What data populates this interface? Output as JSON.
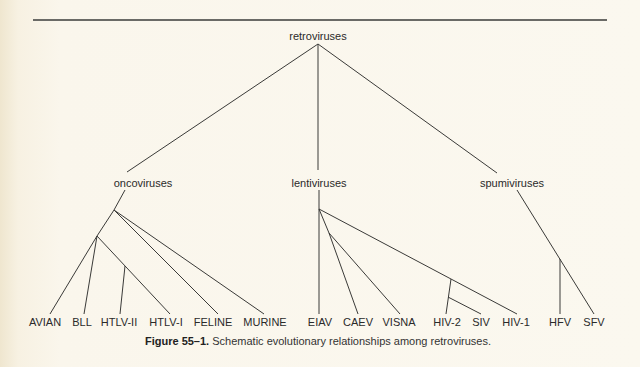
{
  "figure": {
    "root": {
      "label": "retroviruses",
      "x": 318,
      "y": 38
    },
    "groups": [
      {
        "id": "onco",
        "label": "oncoviruses",
        "x": 143,
        "y": 177
      },
      {
        "id": "lenti",
        "label": "lentiviruses",
        "x": 319,
        "y": 177
      },
      {
        "id": "spumi",
        "label": "spumiviruses",
        "x": 512,
        "y": 177
      }
    ],
    "leaves": [
      {
        "label": "AVIAN",
        "x": 45
      },
      {
        "label": "BLL",
        "x": 82
      },
      {
        "label": "HTLV-II",
        "x": 119
      },
      {
        "label": "HTLV-I",
        "x": 166
      },
      {
        "label": "FELINE",
        "x": 213
      },
      {
        "label": "MURINE",
        "x": 265
      },
      {
        "label": "EIAV",
        "x": 320
      },
      {
        "label": "CAEV",
        "x": 358
      },
      {
        "label": "VISNA",
        "x": 399
      },
      {
        "label": "HIV-2",
        "x": 447
      },
      {
        "label": "SIV",
        "x": 481
      },
      {
        "label": "HIV-1",
        "x": 516
      },
      {
        "label": "HFV",
        "x": 560
      },
      {
        "label": "SFV",
        "x": 594
      }
    ],
    "edges": [
      [
        318,
        44,
        127,
        172
      ],
      [
        318,
        44,
        318,
        170
      ],
      [
        318,
        44,
        497,
        173
      ],
      [
        125,
        190,
        114,
        210
      ],
      [
        114,
        210,
        97,
        236
      ],
      [
        114,
        210,
        264,
        314
      ],
      [
        114,
        210,
        218,
        314
      ],
      [
        97,
        236,
        50,
        314
      ],
      [
        97,
        236,
        84,
        314
      ],
      [
        97,
        236,
        170,
        314
      ],
      [
        125,
        266,
        120,
        314
      ],
      [
        319,
        190,
        319,
        314
      ],
      [
        319,
        209,
        517,
        314
      ],
      [
        319,
        209,
        329,
        233
      ],
      [
        329,
        233,
        358,
        314
      ],
      [
        329,
        233,
        400,
        314
      ],
      [
        451,
        279,
        446,
        314
      ],
      [
        448,
        297,
        481,
        314
      ],
      [
        517,
        190,
        594,
        314
      ],
      [
        560,
        259,
        560,
        314
      ]
    ],
    "caption_bold": "Figure 55–1.",
    "caption_text": " Schematic evolutionary relationships among retroviruses."
  }
}
